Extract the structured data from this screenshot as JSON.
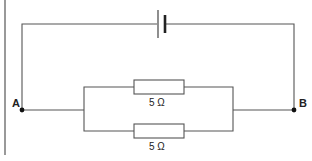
{
  "diagram": {
    "type": "circuit",
    "components": {
      "battery": {
        "label": ""
      },
      "resistor_top": {
        "label": "5 Ω"
      },
      "resistor_bottom": {
        "label": "5 Ω"
      }
    },
    "nodes": {
      "A": {
        "label": "A"
      },
      "B": {
        "label": "B"
      }
    },
    "colors": {
      "wire": "#555555",
      "dot": "#111111"
    }
  }
}
